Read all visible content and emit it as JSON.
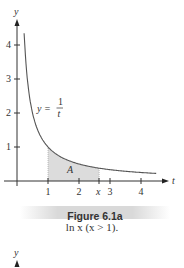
{
  "chart_data": {
    "type": "line",
    "title": "Figure 6.1a",
    "caption": "ln x  (x > 1).",
    "xlabel": "t",
    "ylabel": "y",
    "function": "y = 1/t",
    "curve_label_lhs": "y =",
    "curve_label_num": "1",
    "curve_label_den": "t",
    "area_label": "A",
    "shaded_region": {
      "from": 1,
      "to": "x",
      "x_value_approx": 2.65
    },
    "x_ticks": [
      "1",
      "2",
      "x",
      "3",
      "4"
    ],
    "y_ticks": [
      "1",
      "2",
      "3",
      "4"
    ],
    "xlim": [
      0,
      4.8
    ],
    "ylim": [
      0,
      4.6
    ],
    "x": [
      0.23,
      0.3,
      0.4,
      0.5,
      0.75,
      1,
      1.5,
      2,
      2.5,
      3,
      3.5,
      4,
      4.5
    ],
    "y": [
      4.35,
      3.33,
      2.5,
      2.0,
      1.33,
      1.0,
      0.67,
      0.5,
      0.4,
      0.33,
      0.29,
      0.25,
      0.22
    ],
    "grid": false
  },
  "figure": {
    "title": "Figure 6.1a",
    "caption": "ln x  (x > 1).",
    "next_figure_axis_label": "y"
  },
  "colors": {
    "curve": "#555555",
    "axis": "#333333",
    "shade": "#dcdcdc",
    "caption_bar": "#d9d9d9"
  }
}
